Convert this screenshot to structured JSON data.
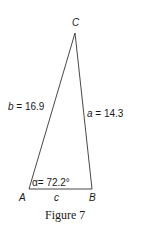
{
  "figure": {
    "caption": "Figure 7",
    "vertices": {
      "A": "A",
      "B": "B",
      "C": "C"
    },
    "sides": {
      "a": "a = 14.3",
      "b": "b = 16.9",
      "c": "c"
    },
    "angle_alpha": "α= 72.2°"
  },
  "colors": {
    "stroke": "#333333",
    "text": "#1a1a1a",
    "background": "#ffffff"
  }
}
